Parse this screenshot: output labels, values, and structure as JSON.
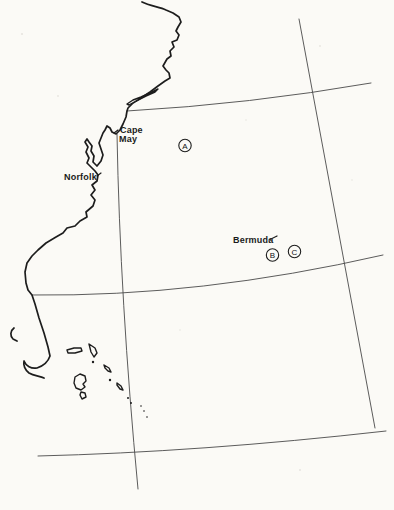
{
  "figure": {
    "type": "map",
    "region_description": "Western North Atlantic: US East Coast from New England to Florida with Bahamas and Bermuda",
    "background_color": "#fbfaf6",
    "coast_line_color": "#1d1d1d",
    "grid_line_color": "#4a4a4a",
    "marker_style": "circled-letter"
  },
  "labels": {
    "cape_may": {
      "line1": "Cape",
      "line2": "May"
    },
    "norfolk": "Norfolk",
    "bermuda": "Bermuda"
  },
  "stations": [
    {
      "letter": "A"
    },
    {
      "letter": "B"
    },
    {
      "letter": "C"
    }
  ]
}
